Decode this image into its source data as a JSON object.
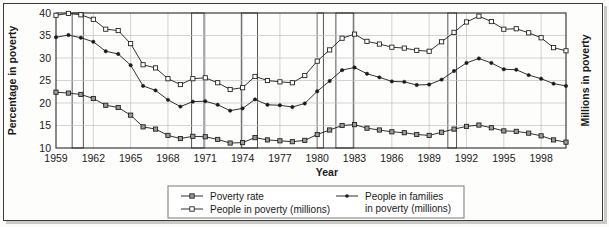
{
  "chart_data": {
    "type": "line",
    "title": "",
    "xlabel": "Year",
    "ylabel": "Percentage in poverty",
    "ylabel_right": "Millions in poverty",
    "xlim": [
      1959,
      2000
    ],
    "ylim": [
      10,
      40
    ],
    "yticks": [
      10,
      15,
      20,
      25,
      30,
      35,
      40
    ],
    "xticks": [
      1959,
      1962,
      1965,
      1968,
      1971,
      1974,
      1977,
      1980,
      1983,
      1986,
      1989,
      1992,
      1995,
      1998
    ],
    "grid": true,
    "legend_position": "bottom",
    "x": [
      1959,
      1960,
      1961,
      1962,
      1963,
      1964,
      1965,
      1966,
      1967,
      1968,
      1969,
      1970,
      1971,
      1972,
      1973,
      1974,
      1975,
      1976,
      1977,
      1978,
      1979,
      1980,
      1981,
      1982,
      1983,
      1984,
      1985,
      1986,
      1987,
      1988,
      1989,
      1990,
      1991,
      1992,
      1993,
      1994,
      1995,
      1996,
      1997,
      1998,
      1999,
      2000
    ],
    "series": [
      {
        "name": "People in poverty (millions)",
        "marker": "open-square",
        "values": [
          39.5,
          39.9,
          39.6,
          38.6,
          36.4,
          36.1,
          33.2,
          28.5,
          27.8,
          25.4,
          24.1,
          25.4,
          25.6,
          24.5,
          23.0,
          23.4,
          25.9,
          25.0,
          24.7,
          24.5,
          26.1,
          29.3,
          31.8,
          34.4,
          35.3,
          33.7,
          33.1,
          32.4,
          32.2,
          31.7,
          31.5,
          33.6,
          35.7,
          38.0,
          39.3,
          38.1,
          36.4,
          36.5,
          35.6,
          34.5,
          32.3,
          31.6
        ]
      },
      {
        "name": "People in families in poverty (millions)",
        "marker": "filled-circle",
        "values": [
          34.6,
          35.1,
          34.5,
          33.6,
          31.5,
          30.9,
          28.4,
          23.8,
          22.8,
          20.7,
          19.2,
          20.3,
          20.4,
          19.6,
          18.3,
          18.8,
          20.8,
          19.6,
          19.5,
          19.1,
          19.9,
          22.6,
          24.9,
          27.3,
          27.9,
          26.5,
          25.7,
          24.8,
          24.7,
          24.0,
          24.1,
          25.2,
          27.1,
          28.9,
          29.9,
          28.9,
          27.5,
          27.4,
          26.2,
          25.4,
          24.3,
          23.8
        ]
      },
      {
        "name": "Poverty rate",
        "marker": "gray-square",
        "values": [
          22.4,
          22.2,
          21.9,
          21.0,
          19.5,
          19.0,
          17.3,
          14.7,
          14.2,
          12.8,
          12.1,
          12.6,
          12.5,
          11.9,
          11.1,
          11.2,
          12.3,
          11.8,
          11.6,
          11.4,
          11.7,
          13.0,
          14.0,
          15.0,
          15.2,
          14.4,
          14.0,
          13.6,
          13.4,
          13.0,
          12.8,
          13.5,
          14.2,
          14.8,
          15.1,
          14.5,
          13.8,
          13.7,
          13.3,
          12.7,
          11.8,
          11.3
        ]
      }
    ],
    "recession_bands": [
      {
        "start": 1960.3,
        "end": 1961.2
      },
      {
        "start": 1969.9,
        "end": 1970.9
      },
      {
        "start": 1973.9,
        "end": 1975.2
      },
      {
        "start": 1980.0,
        "end": 1980.5
      },
      {
        "start": 1981.5,
        "end": 1982.9
      },
      {
        "start": 1990.5,
        "end": 1991.2
      }
    ],
    "legend": [
      {
        "label": "Poverty rate",
        "marker": "gray-square"
      },
      {
        "label": "People in poverty (millions)",
        "marker": "open-square"
      },
      {
        "label": "People in families",
        "label2": "in poverty (millions)",
        "marker": "filled-circle"
      }
    ]
  },
  "colors": {
    "line": "#1a1a1a",
    "grid": "#c0c0c0",
    "frame": "#2a2a2a",
    "background": "#fdfdfc",
    "band_stroke": "#555555"
  }
}
